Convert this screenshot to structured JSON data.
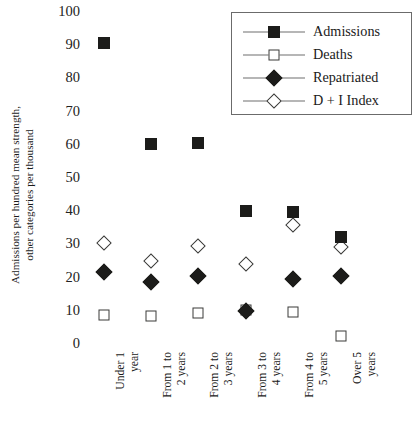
{
  "chart_data": {
    "type": "scatter",
    "title": "",
    "xlabel": "",
    "ylabel_line1": "Admissions per hundred mean strength,",
    "ylabel_line2": "other categories per thousand",
    "ylim": [
      0,
      100
    ],
    "yticks": [
      100,
      90,
      80,
      70,
      60,
      50,
      40,
      30,
      20,
      10,
      0
    ],
    "grid": false,
    "legend_position": "top-right",
    "categories": [
      "Under 1 year",
      "From 1 to 2 years",
      "From 2 to 3 years",
      "From 3 to 4 years",
      "From 4 to 5 years",
      "Over 5 years"
    ],
    "category_lines": [
      [
        "Under 1",
        "year"
      ],
      [
        "From 1 to",
        "2 years"
      ],
      [
        "From 2 to",
        "3 years"
      ],
      [
        "From 3 to",
        "4 years"
      ],
      [
        "From 4 to",
        "5 years"
      ],
      [
        "Over 5",
        "years"
      ]
    ],
    "series": [
      {
        "name": "Admissions",
        "marker": "filled-square",
        "values": [
          90.4,
          60.0,
          60.3,
          39.7,
          39.6,
          31.8
        ]
      },
      {
        "name": "Deaths",
        "marker": "open-square",
        "values": [
          8.5,
          8.0,
          9.0,
          10.0,
          9.3,
          2.2
        ]
      },
      {
        "name": "Repatriated",
        "marker": "filled-diamond",
        "values": [
          21.5,
          18.5,
          20.3,
          9.5,
          19.3,
          20.3
        ]
      },
      {
        "name": "D + I Index",
        "marker": "open-diamond",
        "values": [
          30.0,
          24.8,
          29.3,
          23.8,
          35.5,
          29.0
        ]
      }
    ]
  },
  "legend": {
    "items": [
      {
        "label": "Admissions",
        "marker": "filled-square"
      },
      {
        "label": "Deaths",
        "marker": "open-square"
      },
      {
        "label": "Repatriated",
        "marker": "filled-diamond"
      },
      {
        "label": "D + I Index",
        "marker": "open-diamond"
      }
    ]
  },
  "colors": {
    "filled": "#1c1c1a",
    "open_stroke": "#3a3a38",
    "legend_border": "#6b6b6b",
    "legend_line": "#6f6f6f",
    "background": "#ffffff",
    "text": "#1a1a1a"
  }
}
